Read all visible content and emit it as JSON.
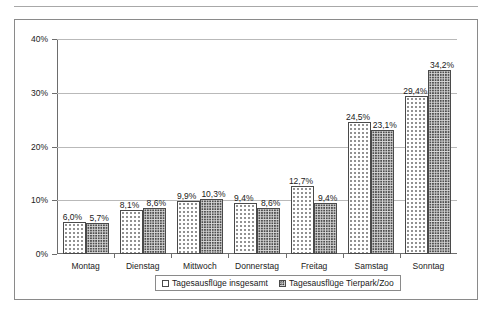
{
  "chart_data": {
    "type": "bar",
    "title": "",
    "subtitle": "",
    "xlabel": "",
    "ylabel": "",
    "ylim": [
      0,
      40
    ],
    "ytick_labels": [
      "0%",
      "10%",
      "20%",
      "30%",
      "40%"
    ],
    "ytick_values": [
      0,
      10,
      20,
      30,
      40
    ],
    "grid": "horizontal",
    "legend_position": "bottom",
    "categories": [
      "Montag",
      "Dienstag",
      "Mittwoch",
      "Donnerstag",
      "Freitag",
      "Samstag",
      "Sonntag"
    ],
    "series": [
      {
        "name": "Tagesausflüge insgesamt",
        "values": [
          6.0,
          8.1,
          9.9,
          9.4,
          12.7,
          24.5,
          29.4
        ],
        "labels": [
          "6,0%",
          "8,1%",
          "9,9%",
          "9,4%",
          "12,7%",
          "24,5%",
          "29,4%"
        ],
        "pattern": "sparse-dots"
      },
      {
        "name": "Tagesausflüge Tierpark/Zoo",
        "values": [
          5.7,
          8.6,
          10.3,
          8.6,
          9.4,
          23.1,
          34.2
        ],
        "labels": [
          "5,7%",
          "8,6%",
          "10,3%",
          "8,6%",
          "9,4%",
          "23,1%",
          "34,2%"
        ],
        "pattern": "dense-checker"
      }
    ]
  },
  "legend": {
    "items": [
      {
        "label": "Tagesausflüge insgesamt",
        "swatch": "legend-swatch-series-1"
      },
      {
        "label": "Tagesausflüge Tierpark/Zoo",
        "swatch": "legend-swatch-series-2"
      }
    ]
  },
  "colors": {
    "frame": "#8a8a8a",
    "axis": "#6d6d6d",
    "gridline": "#b9b9b9",
    "bar_outline": "#4a4a4a",
    "series_1_fill": "#ffffff",
    "series_2_fill": "#d9d9d9",
    "text": "#1a1a1a",
    "background": "#ffffff"
  }
}
